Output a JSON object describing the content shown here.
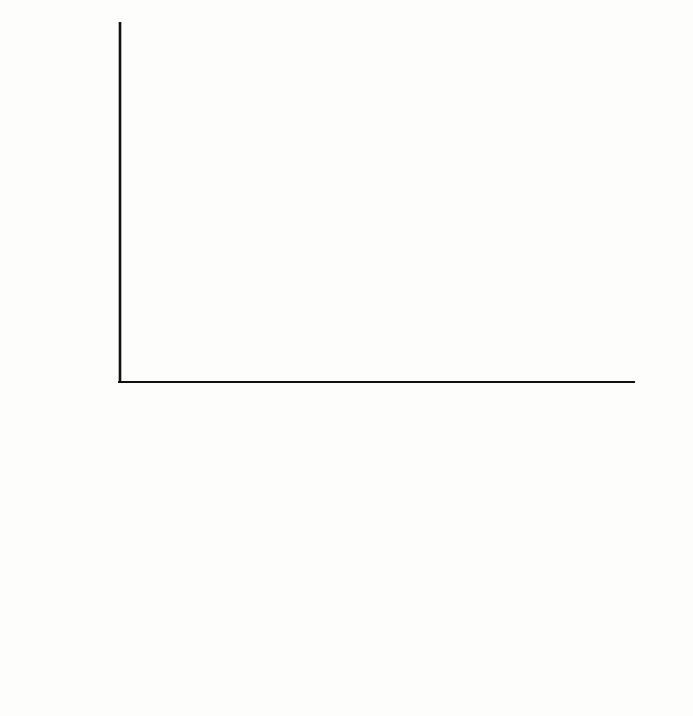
{
  "figure": {
    "background": "#fdfdfb",
    "ink": "#111111"
  },
  "gantt": {
    "y_axis_title": "Activity",
    "x_axis_title": "Time (weeks)",
    "x_ticks": [
      0,
      1,
      2,
      3,
      4,
      5,
      6,
      7,
      8,
      9,
      10,
      11,
      12,
      13,
      14
    ],
    "x_tick_labels": [
      "1",
      "2",
      "3",
      "4",
      "5",
      "6",
      "7",
      "8",
      "9",
      "10",
      "11",
      "12",
      "13",
      "14"
    ],
    "x_min": 0,
    "x_max": 14.5,
    "row_labels": [
      "A",
      "B",
      "C",
      "D",
      "E",
      "F",
      "G",
      "H",
      "I"
    ],
    "legend_fills": {
      "critical_pattern": "stipple",
      "noncritical_fill": "#b9b9b9",
      "float_style": "dashed-outline"
    }
  },
  "chart_data": [
    {
      "type": "bar",
      "title": "Gantt chart of activities",
      "xlabel": "Time (weeks)",
      "ylabel": "Activity",
      "xlim": [
        0,
        14.5
      ],
      "grid": false,
      "orientation": "horizontal",
      "categories": [
        "A",
        "B",
        "C",
        "D",
        "E",
        "F",
        "G",
        "H",
        "I"
      ],
      "bars": [
        {
          "activity": "A",
          "start": 0.0,
          "end": 8.3,
          "duration": 8.3,
          "float_end": 8.3,
          "float": 0.0,
          "critical": true,
          "pattern": "stipple"
        },
        {
          "activity": "B",
          "start": 8.3,
          "end": 12.5,
          "duration": 4.2,
          "float_end": 12.5,
          "float": 0.0,
          "critical": true,
          "pattern": "stipple"
        },
        {
          "activity": "C",
          "start": 12.5,
          "end": 14.5,
          "duration": 2.0,
          "float_end": 14.5,
          "float": 0.0,
          "critical": true,
          "pattern": "stipple"
        },
        {
          "activity": "D",
          "start": 0.0,
          "end": 3.5,
          "duration": 3.5,
          "float_end": 5.5,
          "float": 2.0,
          "critical": false,
          "pattern": "solid-gray"
        },
        {
          "activity": "E",
          "start": 3.5,
          "end": 9.5,
          "duration": 6.0,
          "float_end": 11.3,
          "float": 1.8,
          "critical": false,
          "pattern": "solid-gray"
        },
        {
          "activity": "F",
          "start": 9.5,
          "end": 12.5,
          "duration": 3.0,
          "float_end": 14.5,
          "float": 2.0,
          "critical": false,
          "pattern": "solid-gray"
        },
        {
          "activity": "G",
          "start": 0.0,
          "end": 2.5,
          "duration": 2.5,
          "float_end": 6.5,
          "float": 4.0,
          "critical": false,
          "pattern": "solid-gray"
        },
        {
          "activity": "H",
          "start": 2.5,
          "end": 6.5,
          "duration": 4.0,
          "float_end": 11.3,
          "float": 4.8,
          "critical": false,
          "pattern": "solid-gray"
        },
        {
          "activity": "I",
          "start": 6.5,
          "end": 10.5,
          "duration": 4.0,
          "float_end": 14.5,
          "float": 4.0,
          "critical": false,
          "pattern": "solid-gray"
        }
      ]
    },
    {
      "type": "bar",
      "title": "Resource histogram",
      "xlabel": "Time (weeks)",
      "ylabel": "Number of resources needed",
      "xlim": [
        0,
        14.5
      ],
      "ylim": [
        0,
        3
      ],
      "y_ticks": [
        1,
        2,
        3
      ],
      "y_tick_labels": [
        "1",
        "2",
        "3"
      ],
      "x_tick_labels": [
        "1",
        "2",
        "3",
        "4",
        "5",
        "6",
        "7",
        "8",
        "9",
        "10",
        "11",
        "12",
        "13",
        "14"
      ],
      "stacked": true,
      "cells": [
        {
          "label": "A",
          "level": 1,
          "start": 0.0,
          "end": 2.5
        },
        {
          "label": "A",
          "level": 1,
          "start": 2.5,
          "end": 3.5
        },
        {
          "label": "A",
          "level": 1,
          "start": 3.5,
          "end": 6.5
        },
        {
          "label": "A",
          "level": 1,
          "start": 6.5,
          "end": 8.5
        },
        {
          "label": "B",
          "level": 1,
          "start": 8.5,
          "end": 9.5
        },
        {
          "label": "B",
          "level": 1,
          "start": 9.5,
          "end": 10.5
        },
        {
          "label": "B",
          "level": 1,
          "start": 10.5,
          "end": 12.5
        },
        {
          "label": "B",
          "level": 1,
          "start": 12.5,
          "end": 14.5
        },
        {
          "label": "D",
          "level": 2,
          "start": 0.0,
          "end": 2.5
        },
        {
          "label": "D",
          "level": 2,
          "start": 2.5,
          "end": 3.5
        },
        {
          "label": "E",
          "level": 2,
          "start": 3.5,
          "end": 6.5
        },
        {
          "label": "E",
          "level": 2,
          "start": 6.5,
          "end": 8.5
        },
        {
          "label": "E",
          "level": 2,
          "start": 8.5,
          "end": 9.5
        },
        {
          "label": "F",
          "level": 2,
          "start": 9.5,
          "end": 10.5
        },
        {
          "label": "F",
          "level": 2,
          "start": 10.5,
          "end": 12.5
        },
        {
          "label": "G",
          "level": 3,
          "start": 0.0,
          "end": 2.5
        },
        {
          "label": "H",
          "level": 3,
          "start": 2.5,
          "end": 3.5
        },
        {
          "label": "H",
          "level": 3,
          "start": 3.5,
          "end": 6.5
        },
        {
          "label": "I",
          "level": 3,
          "start": 6.5,
          "end": 8.5
        },
        {
          "label": "I",
          "level": 3,
          "start": 8.5,
          "end": 9.5
        },
        {
          "label": "I",
          "level": 3,
          "start": 9.5,
          "end": 10.5
        }
      ]
    }
  ],
  "histogram": {
    "y_axis_title_line1": "Numberof",
    "y_axis_title_line2": "resources needed",
    "x_axis_title": "Time (weeks)",
    "y_tick_labels": [
      "1",
      "2",
      "3"
    ],
    "x_tick_labels": [
      "1",
      "2",
      "3",
      "4",
      "5",
      "6",
      "7",
      "8",
      "9",
      "10",
      "11",
      "12",
      "13",
      "14"
    ]
  }
}
